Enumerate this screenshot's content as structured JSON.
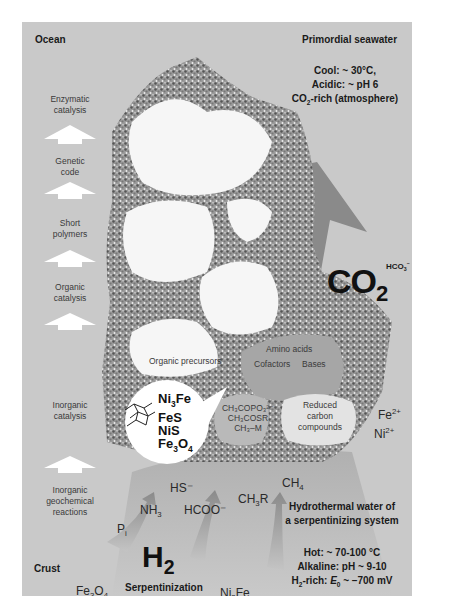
{
  "regions": {
    "top_left": "Ocean",
    "top_right": "Primordial seawater",
    "bottom_left": "Crust"
  },
  "seawater_conditions": {
    "line1": "Cool: ~ 30°C,",
    "line2": "Acidic: ~ pH 6",
    "line3_prefix": "CO",
    "line3_sub": "2",
    "line3_suffix": "-rich (atmosphere)"
  },
  "hydrothermal": {
    "title_line1": "Hydrothermal water of",
    "title_line2": "a serpentinizing system",
    "cond1": "Hot: ~ 70-100 °C",
    "cond2": "Alkaline: pH ~ 9-10",
    "cond3_prefix": "H",
    "cond3_sub": "2",
    "cond3_mid": "-rich: ",
    "cond3_E": "E",
    "cond3_E_sub": "0",
    "cond3_suffix": " ~ –700 mV"
  },
  "evolution_stages": [
    {
      "line1": "Enzymatic",
      "line2": "catalysis"
    },
    {
      "line1": "Genetic",
      "line2": "code"
    },
    {
      "line1": "Short",
      "line2": "polymers"
    },
    {
      "line1": "Organic",
      "line2": "catalysis"
    },
    {
      "line1": "Inorganic",
      "line2": "catalysis"
    },
    {
      "line1": "Inorganic",
      "line2": "geochemical",
      "line3": "reactions"
    }
  ],
  "compartments": {
    "organic_precursors": "Organic precursors",
    "amino_acids": "Amino acids",
    "cofactors": "Cofactors",
    "bases": "Bases",
    "thioester_1": "CH₃COPO₃²⁻",
    "thioester_2": "CH₃COSR",
    "thioester_3": "CH₃–M",
    "reduced_1": "Reduced",
    "reduced_2": "carbon",
    "reduced_3": "compounds"
  },
  "minerals_bubble": {
    "m1_a": "Ni",
    "m1_sub": "3",
    "m1_b": "Fe",
    "m2": "FeS",
    "m3": "NiS",
    "m4_a": "Fe",
    "m4_sub1": "3",
    "m4_b": "O",
    "m4_sub2": "4"
  },
  "co2_arrow": {
    "label": "CO",
    "label_sub": "2",
    "hco3": "HCO",
    "hco3_sub": "3",
    "hco3_sup": "–"
  },
  "ions": {
    "fe": "Fe",
    "fe_sup": "2+",
    "ni": "Ni",
    "ni_sup": "2+"
  },
  "hydrothermal_species": {
    "hs": "HS⁻",
    "nh3": "NH",
    "nh3_sub": "3",
    "hcoo": "HCOO⁻",
    "ch3r_a": "CH",
    "ch3r_sub": "3",
    "ch3r_b": "R",
    "ch4": "CH",
    "ch4_sub": "4",
    "pi": "P",
    "pi_sub": "i"
  },
  "crust": {
    "h2": "H",
    "h2_sub": "2",
    "serpentinization": "Serpentinization",
    "fe3o4_a": "Fe",
    "fe3o4_sub1": "3",
    "fe3o4_b": "O",
    "fe3o4_sub2": "4",
    "ni3fe_a": "Ni",
    "ni3fe_sub": "3",
    "ni3fe_b": "Fe"
  },
  "colors": {
    "background": "#c9c9c9",
    "co2_arrow": "#8a8a8a",
    "compartment_interior": "#f8f8f8",
    "stage_arrows": "#ffffff",
    "hydrothermal_plume": "#b5b5b5"
  }
}
